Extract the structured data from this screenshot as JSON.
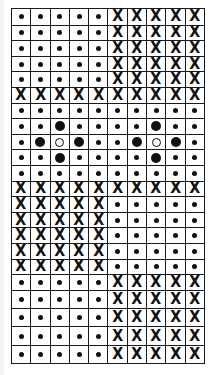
{
  "legend": {
    "dot": "small-dot",
    "big": "large-filled-dot",
    "open": "open-circle",
    "x": "X"
  },
  "symbols": {
    "x_glyph": "X"
  },
  "grid": {
    "columns": 10,
    "rows": [
      {
        "height": 15.6,
        "cells": [
          "dot",
          "dot",
          "dot",
          "dot",
          "dot",
          "x",
          "x",
          "x",
          "x",
          "x"
        ]
      },
      {
        "height": 15.6,
        "cells": [
          "dot",
          "dot",
          "dot",
          "dot",
          "dot",
          "x",
          "x",
          "x",
          "x",
          "x"
        ]
      },
      {
        "height": 15.6,
        "cells": [
          "dot",
          "dot",
          "dot",
          "dot",
          "dot",
          "x",
          "x",
          "x",
          "x",
          "x"
        ]
      },
      {
        "height": 15.6,
        "cells": [
          "dot",
          "dot",
          "dot",
          "dot",
          "dot",
          "x",
          "x",
          "x",
          "x",
          "x"
        ]
      },
      {
        "height": 15.6,
        "cells": [
          "dot",
          "dot",
          "dot",
          "dot",
          "dot",
          "x",
          "x",
          "x",
          "x",
          "x"
        ]
      },
      {
        "height": 15.6,
        "cells": [
          "x",
          "x",
          "x",
          "x",
          "x",
          "x",
          "x",
          "x",
          "x",
          "x"
        ]
      },
      {
        "height": 15.6,
        "cells": [
          "dot",
          "dot",
          "dot",
          "dot",
          "dot",
          "dot",
          "dot",
          "dot",
          "dot",
          "dot"
        ]
      },
      {
        "height": 15.6,
        "cells": [
          "dot",
          "dot",
          "big",
          "dot",
          "dot",
          "dot",
          "dot",
          "big",
          "dot",
          "dot"
        ]
      },
      {
        "height": 15.6,
        "cells": [
          "dot",
          "big",
          "open",
          "big",
          "dot",
          "dot",
          "big",
          "open",
          "big",
          "dot"
        ]
      },
      {
        "height": 15.6,
        "cells": [
          "dot",
          "dot",
          "big",
          "dot",
          "dot",
          "dot",
          "dot",
          "big",
          "dot",
          "dot"
        ]
      },
      {
        "height": 15.6,
        "cells": [
          "dot",
          "dot",
          "dot",
          "dot",
          "dot",
          "dot",
          "dot",
          "dot",
          "dot",
          "dot"
        ]
      },
      {
        "height": 15.6,
        "cells": [
          "x",
          "x",
          "x",
          "x",
          "x",
          "x",
          "x",
          "x",
          "x",
          "x"
        ]
      },
      {
        "height": 15.6,
        "cells": [
          "x",
          "x",
          "x",
          "x",
          "x",
          "dot",
          "dot",
          "dot",
          "dot",
          "dot"
        ]
      },
      {
        "height": 15.6,
        "cells": [
          "x",
          "x",
          "x",
          "x",
          "x",
          "dot",
          "dot",
          "dot",
          "dot",
          "dot"
        ]
      },
      {
        "height": 15.6,
        "cells": [
          "x",
          "x",
          "x",
          "x",
          "x",
          "dot",
          "dot",
          "dot",
          "dot",
          "dot"
        ]
      },
      {
        "height": 15.6,
        "cells": [
          "x",
          "x",
          "x",
          "x",
          "x",
          "dot",
          "dot",
          "dot",
          "dot",
          "dot"
        ]
      },
      {
        "height": 15.6,
        "cells": [
          "x",
          "x",
          "x",
          "x",
          "x",
          "dot",
          "dot",
          "dot",
          "dot",
          "dot"
        ]
      },
      {
        "height": 15.6,
        "cells": [
          "dot",
          "dot",
          "dot",
          "dot",
          "dot",
          "x",
          "x",
          "x",
          "x",
          "x"
        ]
      },
      {
        "height": 18.4,
        "cells": [
          "dot",
          "dot",
          "dot",
          "dot",
          "dot",
          "x",
          "x",
          "x",
          "x",
          "x"
        ]
      },
      {
        "height": 18.4,
        "cells": [
          "dot",
          "dot",
          "dot",
          "dot",
          "dot",
          "x",
          "x",
          "x",
          "x",
          "x"
        ]
      },
      {
        "height": 18.4,
        "cells": [
          "dot",
          "dot",
          "dot",
          "dot",
          "dot",
          "x",
          "x",
          "x",
          "x",
          "x"
        ]
      },
      {
        "height": 18.4,
        "cells": [
          "dot",
          "dot",
          "dot",
          "dot",
          "dot",
          "x",
          "x",
          "x",
          "x",
          "x"
        ]
      }
    ]
  },
  "colors": {
    "ink": "#111111",
    "background": "#ffffff",
    "grid_line": "#1a1a1a"
  }
}
